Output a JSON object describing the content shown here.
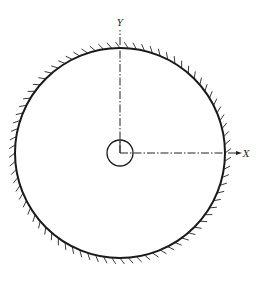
{
  "diagram": {
    "type": "circular boundary with hatched (fixed/supported) edge and coordinate axes",
    "axes": {
      "x_label": "X",
      "y_label": "Y"
    },
    "outer_circle": {
      "cx": 120,
      "cy": 153,
      "r": 105,
      "hatched": true
    },
    "inner_circle": {
      "cx": 120,
      "cy": 153,
      "r": 13
    },
    "colors": {
      "line": "#1a1a1a",
      "background": "#ffffff"
    }
  }
}
